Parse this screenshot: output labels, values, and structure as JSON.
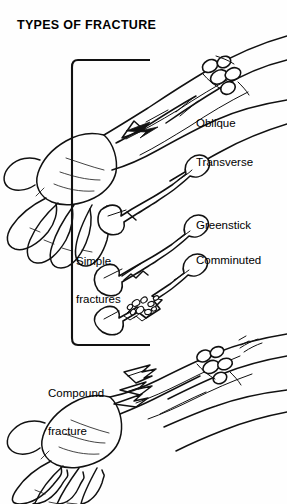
{
  "title": "TYPES OF FRACTURE",
  "labels": {
    "oblique": "Oblique",
    "transverse": "Transverse",
    "greenstick": "Greenstick",
    "comminuted": "Comminuted",
    "simple_line1": "Simple",
    "simple_line2": "fractures",
    "compound_line1": "Compound",
    "compound_line2": "fracture"
  },
  "colors": {
    "ink": "#111111",
    "background": "#ffffff"
  },
  "illustration": {
    "top_arm": "forearm-with-hand-showing-oblique-fracture",
    "bottom_arm": "forearm-with-hand-showing-compound-open-fracture",
    "bones": [
      "oblique-fracture-bone",
      "transverse-fracture-bone",
      "greenstick-fracture-bone",
      "comminuted-fracture-bone"
    ],
    "bracket": "simple-fractures-grouping-bracket"
  }
}
